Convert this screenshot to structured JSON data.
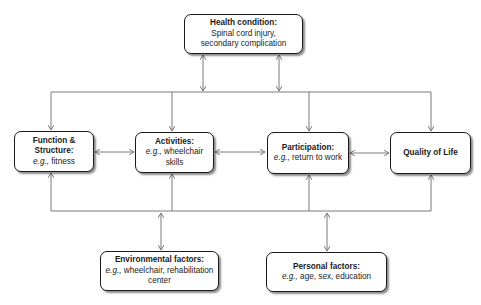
{
  "diagram": {
    "nodes": {
      "health": {
        "title": "Health condition:",
        "text": "Spinal cord injury, secondary complication"
      },
      "function": {
        "title": "Function & Structure:",
        "eg": "e.g.,",
        "text": "fitness"
      },
      "activities": {
        "title": "Activities:",
        "eg": "e.g.,",
        "text": "wheelchair skills"
      },
      "participation": {
        "title": "Participation:",
        "eg": "e.g.,",
        "text": "return to work"
      },
      "quality": {
        "title": "Quality of Life"
      },
      "environmental": {
        "title": "Environmental factors:",
        "eg": "e.g.,",
        "text": "wheelchair, rehabilitation center"
      },
      "personal": {
        "title": "Personal factors:",
        "eg": "e.g.,",
        "text": "age, sex, education"
      }
    },
    "edges": [
      {
        "from": "health",
        "to": "top-bus",
        "type": "bidirectional"
      },
      {
        "from": "top-bus",
        "to": "function",
        "type": "arrow"
      },
      {
        "from": "top-bus",
        "to": "activities",
        "type": "arrow"
      },
      {
        "from": "top-bus",
        "to": "participation",
        "type": "arrow"
      },
      {
        "from": "top-bus",
        "to": "quality",
        "type": "arrow"
      },
      {
        "from": "function",
        "to": "activities",
        "type": "bidirectional"
      },
      {
        "from": "activities",
        "to": "participation",
        "type": "bidirectional"
      },
      {
        "from": "participation",
        "to": "quality",
        "type": "bidirectional"
      },
      {
        "from": "bottom-bus",
        "to": "function",
        "type": "arrow"
      },
      {
        "from": "bottom-bus",
        "to": "activities",
        "type": "arrow"
      },
      {
        "from": "bottom-bus",
        "to": "participation",
        "type": "arrow"
      },
      {
        "from": "bottom-bus",
        "to": "quality",
        "type": "arrow"
      },
      {
        "from": "environmental",
        "to": "bottom-bus",
        "type": "bidirectional"
      },
      {
        "from": "personal",
        "to": "bottom-bus",
        "type": "bidirectional"
      }
    ],
    "colors": {
      "line": "#6b6b6b",
      "border": "#1a1a1a"
    }
  }
}
